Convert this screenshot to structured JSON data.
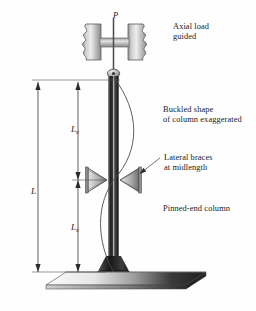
{
  "figure": {
    "background_color": "#fefefe",
    "ink_color": "#1a1a1a"
  },
  "labels": {
    "axial_load_line1": "Axial load",
    "axial_load_line2": "guided",
    "buckled_line1": "Buckled shape",
    "buckled_line2": "of column exaggerated",
    "braces_line1": "Lateral braces",
    "braces_line2": "at midlength",
    "pinned_end": "Pinned-end column",
    "load_symbol": "P"
  },
  "dimensions": {
    "total": {
      "symbol": "L",
      "subscript": ""
    },
    "upper_effective": {
      "symbol": "L",
      "subscript": "e"
    },
    "lower_effective": {
      "symbol": "L",
      "subscript": "e"
    }
  },
  "colors": {
    "column_dark": "#2b2b2b",
    "column_highlight": "#d8d8d8",
    "block_gray": "#b4b4b4",
    "block_edge": "#6e6e6e",
    "base_plate_light": "#f2f2f2",
    "base_plate_dark": "#2e2e2e",
    "line": "#333333",
    "curve": "#555555"
  }
}
